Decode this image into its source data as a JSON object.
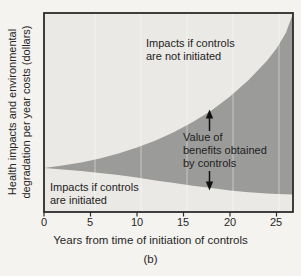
{
  "figure": {
    "caption": "(b)",
    "colors": {
      "page_bg": "#f4f3ef",
      "plot_bg": "#eae9e5",
      "band_fill": "#9b9b99",
      "border": "#2c2c2c",
      "text": "#262626"
    }
  },
  "y_axis": {
    "label_line1": "Health impacts and environmental",
    "label_line2": "degradation per year costs (dollars)"
  },
  "x_axis": {
    "label": "Years from time of initiation of controls",
    "ticks": [
      "0",
      "5",
      "10",
      "15",
      "20",
      "25"
    ]
  },
  "annotations": {
    "upper": {
      "line1": "Impacts if controls",
      "line2": "are not initiated"
    },
    "middle": {
      "line1": "Value of",
      "line2": "benefits obtained",
      "line3": "by controls"
    },
    "lower": {
      "line1": "Impacts if controls",
      "line2": "are initiated"
    }
  },
  "chart_data": {
    "type": "area",
    "title": "",
    "xlabel": "Years from time of initiation of controls",
    "ylabel": "Health impacts and environmental degradation per year costs (dollars)",
    "subfigure": "(b)",
    "xlim": [
      0,
      26.8
    ],
    "x_ticks": [
      0,
      5,
      10,
      15,
      20,
      25
    ],
    "y_axis_numeric": false,
    "units_note": "y axis unlabeled (dollars, qualitative); values are relative 0-100 estimates",
    "x": [
      0,
      2,
      4,
      6,
      8,
      10,
      12,
      14,
      16,
      18,
      20,
      22,
      24,
      25,
      26,
      26.8
    ],
    "series": [
      {
        "name": "Impacts if controls are not initiated",
        "values": [
          22.1,
          23.4,
          24.9,
          26.9,
          29.4,
          32.4,
          35.9,
          40.2,
          45.2,
          51.0,
          58.0,
          66.3,
          76.1,
          82.2,
          89.9,
          100.0
        ]
      },
      {
        "name": "Impacts if controls are initiated",
        "values": [
          22.1,
          21.4,
          20.6,
          19.6,
          18.6,
          17.3,
          15.9,
          14.6,
          13.2,
          12.0,
          10.8,
          9.9,
          9.3,
          9.0,
          8.9,
          8.8
        ]
      }
    ],
    "band_label": "Value of benefits obtained by controls",
    "legend_position": "none",
    "grid": false
  }
}
